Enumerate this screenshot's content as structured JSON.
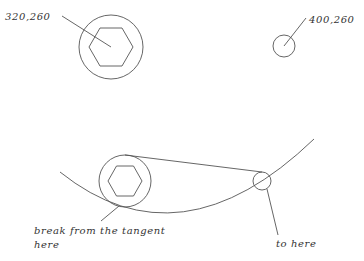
{
  "diagram": {
    "labels": {
      "top_left_coord": "320,260",
      "top_right_coord": "400,260",
      "break_line1": "break from the tangent",
      "break_line2": "here",
      "to_here": "to here"
    },
    "shapes": {
      "top_large_circle": {
        "cx": 111,
        "cy": 47,
        "r": 32
      },
      "top_hexagon": {
        "cx": 111,
        "cy": 47,
        "r": 22
      },
      "top_small_circle": {
        "cx": 284,
        "cy": 46,
        "r": 11
      },
      "bottom_large_circle": {
        "cx": 125,
        "cy": 181,
        "r": 26
      },
      "bottom_hexagon": {
        "cx": 125,
        "cy": 181,
        "r": 17
      },
      "bottom_small_circle": {
        "cx": 262,
        "cy": 181,
        "r": 9
      }
    },
    "colors": {
      "stroke": "#555555",
      "text": "#333333",
      "background": "#ffffff"
    }
  }
}
